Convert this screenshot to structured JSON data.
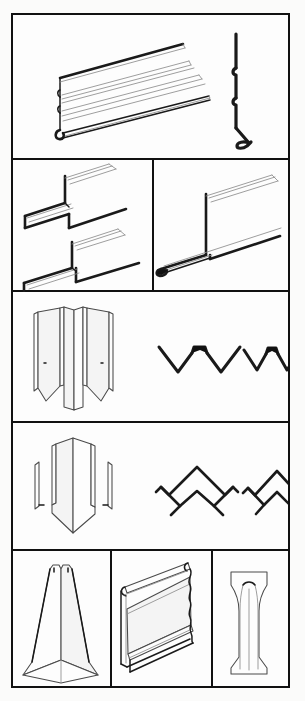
{
  "document": {
    "title": "Siding Components Figure Plate",
    "kind": "technical-line-drawing",
    "sheet_width_px": 305,
    "sheet_height_px": 701,
    "background_color": "#fbfbfa",
    "ink_color": "#1a1a1a",
    "light_ink_color": "#8d8d8d",
    "fill_color": "#fdfdfd",
    "border": {
      "name": "outer-frame",
      "left_px": 11,
      "top_px": 13,
      "width_px": 279,
      "height_px": 675,
      "stroke_px": 2.5
    },
    "rules": {
      "horizontal_y": [
        158,
        290,
        421,
        549
      ],
      "vertical": [
        {
          "x": 152,
          "y1": 158,
          "y2": 290
        },
        {
          "x": 110,
          "y1": 549,
          "y2": 686
        },
        {
          "x": 211,
          "y1": 549,
          "y2": 686
        }
      ]
    },
    "row_count": 5
  },
  "figures": [
    {
      "id": "fig-1",
      "row": 1,
      "cell": "row1-full",
      "name": "horizontal-siding-panel",
      "label": "Horizontal lap siding panel, perspective view",
      "views": [
        "perspective",
        "section"
      ],
      "section_name": "siding-panel-section",
      "section_label": "Panel end section with nail hem and bottom lock"
    },
    {
      "id": "fig-2",
      "row": 2,
      "cell": "row2-left",
      "name": "j-channel-trim-pair",
      "label": "J-channel trim, two lengths, perspective view",
      "views": [
        "perspective"
      ],
      "piece_count": 2
    },
    {
      "id": "fig-3",
      "row": 2,
      "cell": "row2-right",
      "name": "starter-strip-trim",
      "label": "Starter strip / undersill trim, perspective view",
      "views": [
        "perspective"
      ],
      "piece_count": 1
    },
    {
      "id": "fig-4",
      "row": 3,
      "cell": "row3-left",
      "name": "inside-corner-post",
      "label": "Inside corner post, perspective view",
      "views": [
        "perspective"
      ]
    },
    {
      "id": "fig-5",
      "row": 3,
      "cell": "row3-right",
      "name": "inside-corner-post-sections",
      "label": "Inside corner post cross sections, wide and narrow",
      "views": [
        "section"
      ],
      "section_count": 2,
      "section_labels": [
        "wide W section",
        "narrow W section"
      ]
    },
    {
      "id": "fig-6",
      "row": 4,
      "cell": "row4-left",
      "name": "outside-corner-post",
      "label": "Outside corner post, perspective view",
      "views": [
        "perspective"
      ]
    },
    {
      "id": "fig-7",
      "row": 4,
      "cell": "row4-right",
      "name": "outside-corner-post-sections",
      "label": "Outside corner post cross sections, wide and narrow",
      "views": [
        "section"
      ],
      "section_count": 2,
      "section_labels": [
        "wide chevron section",
        "narrow chevron section"
      ]
    },
    {
      "id": "fig-8",
      "row": 5,
      "cell": "row5-left",
      "name": "corner-cap-tapered",
      "label": "Tapered corner cap, perspective view",
      "views": [
        "perspective"
      ]
    },
    {
      "id": "fig-9",
      "row": 5,
      "cell": "row5-center",
      "name": "siding-panel-short-section",
      "label": "Short siding panel segment, perspective view",
      "views": [
        "perspective"
      ]
    },
    {
      "id": "fig-10",
      "row": 5,
      "cell": "row5-right",
      "name": "hourglass-trim-piece",
      "label": "Hourglass profile trim piece, elevation view",
      "views": [
        "elevation"
      ]
    }
  ]
}
